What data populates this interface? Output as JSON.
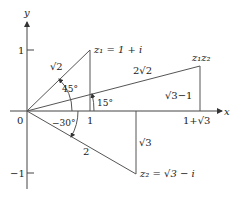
{
  "diagram": {
    "axes": {
      "x_label": "x",
      "y_label": "y",
      "origin_label": "0",
      "x_tick_label": "1",
      "y_tick_pos_label": "1",
      "y_tick_neg_label": "−1",
      "x_product_label": "1+√3"
    },
    "points": {
      "z1": {
        "label": "z₁ = 1 + i",
        "re": 1,
        "im": 1
      },
      "z2": {
        "label": "z₂ = √3 − i",
        "re": 1.732,
        "im": -1
      },
      "z1z2": {
        "label": "z₁z₂",
        "re": 2.732,
        "im": 0.732
      }
    },
    "edge_labels": {
      "z1_modulus": "√2",
      "z2_modulus": "2",
      "product_modulus": "2√2",
      "z2_imag": "√3",
      "product_imag": "√3−1"
    },
    "angles": {
      "z1_arg": "45°",
      "z2_arg": "−30°",
      "product_arg": "15°"
    },
    "colors": {
      "line": "#555555",
      "text": "#222222",
      "background": "#ffffff"
    }
  }
}
